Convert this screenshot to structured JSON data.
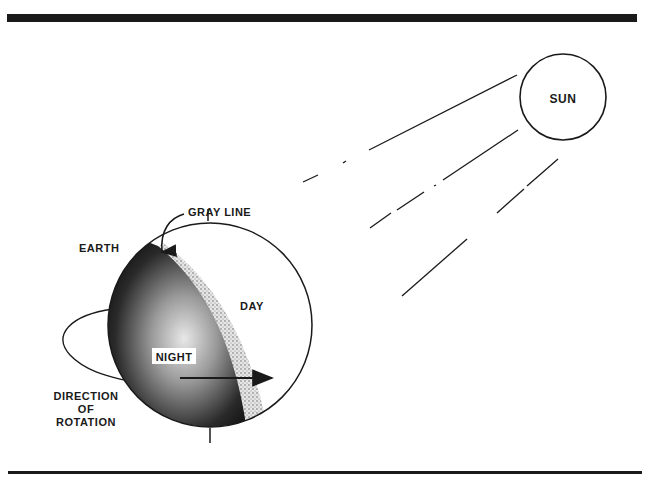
{
  "diagram": {
    "labels": {
      "sun": "SUN",
      "gray_line": "GRAY LINE",
      "earth": "EARTH",
      "day": "DAY",
      "night": "NIGHT",
      "direction_line1": "DIRECTION",
      "direction_line2": "OF",
      "direction_line3": "ROTATION"
    },
    "colors": {
      "ink": "#1a1a1a",
      "night": "#111111",
      "gray_band": "#cfcfcf",
      "background": "#ffffff"
    }
  }
}
